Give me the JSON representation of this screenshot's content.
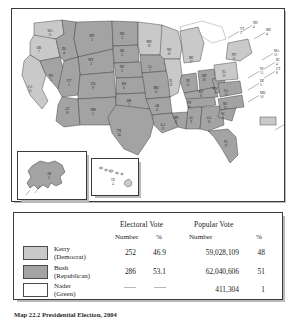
{
  "figure": {
    "caption": "Map 22.2   Presidential Election, 2004"
  },
  "colors": {
    "kerry": "#c9c9c9",
    "bush": "#a3a3a3",
    "nader": "#ffffff",
    "border": "#3a3a3a",
    "water": "#ffffff",
    "shadow": "#b9b9b9"
  },
  "map": {
    "states": [
      {
        "code": "WA",
        "votes": "11",
        "party": "kerry",
        "x": 38,
        "y": 23
      },
      {
        "code": "OR",
        "votes": "7",
        "party": "kerry",
        "x": 27,
        "y": 40
      },
      {
        "code": "CA",
        "votes": "55",
        "party": "kerry",
        "x": 18,
        "y": 79
      },
      {
        "code": "NV",
        "votes": "5",
        "party": "bush",
        "x": 39,
        "y": 68
      },
      {
        "code": "ID",
        "votes": "4",
        "party": "bush",
        "x": 52,
        "y": 41
      },
      {
        "code": "MT",
        "votes": "3",
        "party": "bush",
        "x": 80,
        "y": 28
      },
      {
        "code": "WY",
        "votes": "3",
        "party": "bush",
        "x": 79,
        "y": 52
      },
      {
        "code": "UT",
        "votes": "5",
        "party": "bush",
        "x": 57,
        "y": 73
      },
      {
        "code": "CO",
        "votes": "9",
        "party": "bush",
        "x": 81,
        "y": 76
      },
      {
        "code": "AZ",
        "votes": "10",
        "party": "bush",
        "x": 55,
        "y": 101
      },
      {
        "code": "NM",
        "votes": "5",
        "party": "bush",
        "x": 81,
        "y": 102
      },
      {
        "code": "ND",
        "votes": "3",
        "party": "bush",
        "x": 110,
        "y": 26
      },
      {
        "code": "SD",
        "votes": "3",
        "party": "bush",
        "x": 110,
        "y": 43
      },
      {
        "code": "NE",
        "votes": "5",
        "party": "bush",
        "x": 110,
        "y": 59
      },
      {
        "code": "KS",
        "votes": "6",
        "party": "bush",
        "x": 112,
        "y": 76
      },
      {
        "code": "OK",
        "votes": "7",
        "party": "bush",
        "x": 117,
        "y": 93
      },
      {
        "code": "TX",
        "votes": "34",
        "party": "bush",
        "x": 107,
        "y": 123
      },
      {
        "code": "MN",
        "votes": "10",
        "party": "kerry",
        "x": 137,
        "y": 34
      },
      {
        "code": "IA",
        "votes": "7",
        "party": "bush",
        "x": 138,
        "y": 59
      },
      {
        "code": "MO",
        "votes": "11",
        "party": "bush",
        "x": 144,
        "y": 80
      },
      {
        "code": "AR",
        "votes": "6",
        "party": "bush",
        "x": 145,
        "y": 98
      },
      {
        "code": "LA",
        "votes": "9",
        "party": "bush",
        "x": 151,
        "y": 117
      },
      {
        "code": "WI",
        "votes": "10",
        "party": "kerry",
        "x": 157,
        "y": 42
      },
      {
        "code": "IL",
        "votes": "21",
        "party": "kerry",
        "x": 159,
        "y": 73
      },
      {
        "code": "MS",
        "votes": "6",
        "party": "bush",
        "x": 164,
        "y": 110
      },
      {
        "code": "MI",
        "votes": "17",
        "party": "kerry",
        "x": 179,
        "y": 50
      },
      {
        "code": "IN",
        "votes": "11",
        "party": "bush",
        "x": 176,
        "y": 73
      },
      {
        "code": "TN",
        "votes": "11",
        "party": "bush",
        "x": 177,
        "y": 95
      },
      {
        "code": "AL",
        "votes": "9",
        "party": "bush",
        "x": 179,
        "y": 110
      },
      {
        "code": "OH",
        "votes": "20",
        "party": "bush",
        "x": 192,
        "y": 68
      },
      {
        "code": "KY",
        "votes": "8",
        "party": "bush",
        "x": 189,
        "y": 84
      },
      {
        "code": "GA",
        "votes": "15",
        "party": "bush",
        "x": 197,
        "y": 110
      },
      {
        "code": "WV",
        "votes": "5",
        "party": "bush",
        "x": 203,
        "y": 81
      },
      {
        "code": "VA",
        "votes": "13",
        "party": "bush",
        "x": 214,
        "y": 83
      },
      {
        "code": "NC",
        "votes": "15",
        "party": "bush",
        "x": 213,
        "y": 96
      },
      {
        "code": "SC",
        "votes": "8",
        "party": "bush",
        "x": 211,
        "y": 106
      },
      {
        "code": "FL",
        "votes": "27",
        "party": "bush",
        "x": 214,
        "y": 134
      },
      {
        "code": "PA",
        "votes": "21",
        "party": "kerry",
        "x": 212,
        "y": 64
      },
      {
        "code": "NY",
        "votes": "31",
        "party": "kerry",
        "x": 222,
        "y": 47
      }
    ],
    "callouts": [
      {
        "code": "NH",
        "votes": "4",
        "party": "kerry",
        "tx": 241,
        "ty": 15
      },
      {
        "code": "VT",
        "votes": "3",
        "party": "kerry",
        "tx": 228,
        "ty": 21
      },
      {
        "code": "ME",
        "votes": "4",
        "party": "kerry",
        "tx": 254,
        "ty": 22
      },
      {
        "code": "MA",
        "votes": "12",
        "party": "kerry",
        "tx": 262,
        "ty": 43
      },
      {
        "code": "RI",
        "votes": "4",
        "party": "kerry",
        "tx": 264,
        "ty": 52
      },
      {
        "code": "CT",
        "votes": "8",
        "party": "kerry",
        "tx": 264,
        "ty": 61
      },
      {
        "code": "NJ",
        "votes": "15",
        "party": "kerry",
        "tx": 248,
        "ty": 61
      },
      {
        "code": "DE",
        "votes": "3",
        "party": "kerry",
        "tx": 248,
        "ty": 73
      },
      {
        "code": "MD",
        "votes": "10",
        "party": "kerry",
        "tx": 248,
        "ty": 85
      },
      {
        "code": "DC",
        "votes": "3",
        "party": "kerry",
        "tx": 275,
        "ty": 113
      }
    ],
    "insets": [
      {
        "code": "AK",
        "votes": "3",
        "party": "bush",
        "name": "alaska-inset"
      },
      {
        "code": "HI",
        "votes": "4",
        "party": "kerry",
        "name": "hawaii-inset"
      }
    ]
  },
  "legend": {
    "group_headers": [
      "Electoral Vote",
      "Popular Vote"
    ],
    "sub_headers": [
      "Number",
      "%",
      "Number",
      "%"
    ],
    "rows": [
      {
        "candidate": "Kerry",
        "party": "(Democrat)",
        "swatch": "kerry",
        "electoral_number": "252",
        "electoral_pct": "46.9",
        "popular_number": "59,028,109",
        "popular_pct": "48"
      },
      {
        "candidate": "Bush",
        "party": "(Republican)",
        "swatch": "bush",
        "electoral_number": "286",
        "electoral_pct": "53.1",
        "popular_number": "62,040,606",
        "popular_pct": "51"
      },
      {
        "candidate": "Nader",
        "party": "(Green)",
        "swatch": "nader",
        "electoral_number": "——",
        "electoral_pct": "——",
        "popular_number": "411,304",
        "popular_pct": "1"
      }
    ]
  }
}
